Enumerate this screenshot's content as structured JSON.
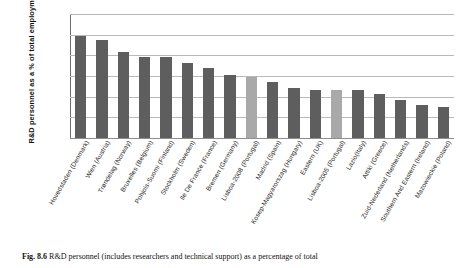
{
  "figure": {
    "caption_label": "Fig. 8.6",
    "caption_text": "R&D personnel (includes researchers and technical support) as a percentage of total"
  },
  "chart_data": {
    "type": "bar",
    "title": "",
    "xlabel": "",
    "ylabel": "R&D personnel as a % of total employment",
    "ylim": [
      0,
      6
    ],
    "yticks": [
      0,
      1,
      2,
      3,
      4,
      5,
      6
    ],
    "grid": true,
    "legend": "none",
    "bar_color": "#5e5e5e",
    "highlight_color": "#a9a9a9",
    "categories": [
      "Hovedstaden (Denmark)",
      "Wien (Austria)",
      "Trøndelag (Norway)",
      "Bruxelles (Belgium)",
      "Pohjois-Suomi (Finland)",
      "Stockholm (Sweden)",
      "Ile De France (France)",
      "Bremen (Germany)",
      "Lisboa-2008 (Portugal)",
      "Madrid (Spain)",
      "Kosep-Magyarorszag (Hungary)",
      "Eastern (UK)",
      "Lisboa-2005 (Portugal)",
      "Lazio(Italy)",
      "Attiki (Greece)",
      "Zuid-Nederland (Netherlands)",
      "Southern And Eastern (Ireland)",
      "Mazowieckie (Poland)"
    ],
    "values": [
      4.95,
      4.73,
      4.18,
      3.92,
      3.92,
      3.62,
      3.4,
      3.05,
      2.95,
      2.72,
      2.4,
      2.32,
      2.3,
      2.33,
      2.15,
      1.85,
      1.58,
      1.52
    ],
    "highlighted": [
      8,
      12
    ]
  }
}
